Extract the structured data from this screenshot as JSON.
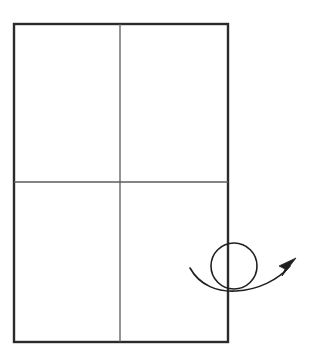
{
  "figure": {
    "kind": "line-diagram",
    "title": "",
    "caption": "",
    "background_color": "#ffffff",
    "canvas": {
      "width": 311,
      "height": 363
    }
  },
  "sheet": {
    "name": "folded-sheet-rectangle",
    "description": "upright rectangle divided into four quadrants",
    "x": 14,
    "y": 24,
    "width": 214,
    "height": 318,
    "border_color": "#2b2b2b",
    "border_width": 2.4,
    "fill_color": "#ffffff"
  },
  "fold_lines": [
    {
      "name": "vertical-fold-line",
      "orientation": "vertical",
      "x1": 120,
      "y1": 24,
      "x2": 120,
      "y2": 342,
      "color": "#5c5c5c",
      "width": 1.3
    },
    {
      "name": "horizontal-fold-line",
      "orientation": "horizontal",
      "x1": 14,
      "y1": 182,
      "x2": 228,
      "y2": 182,
      "color": "#5c5c5c",
      "width": 1.3
    }
  ],
  "quadrants": [
    {
      "name": "quadrant-top-left",
      "label": ""
    },
    {
      "name": "quadrant-top-right",
      "label": ""
    },
    {
      "name": "quadrant-bottom-left",
      "label": ""
    },
    {
      "name": "quadrant-bottom-right",
      "label": ""
    }
  ],
  "rotation_arrow": {
    "name": "rotation-arrow-with-loop",
    "description": "curved arrow sweeping left to right with a loop, indicating a flip or turn",
    "color": "#1f1f1f",
    "stroke_width": 1.6,
    "curve_path": "M 190 268 C 200 286, 218 292, 236 291 C 258 290, 278 280, 290 266",
    "loop": {
      "name": "arrow-loop-circle",
      "center_x": 234,
      "center_y": 266,
      "radius": 23,
      "stroke_width": 1.6
    },
    "arrowhead": {
      "name": "arrowhead",
      "points": "295,259 280,268 285,270 283,275",
      "tip_x": 295,
      "tip_y": 259,
      "direction": "up-right",
      "fill": "#1f1f1f"
    }
  }
}
